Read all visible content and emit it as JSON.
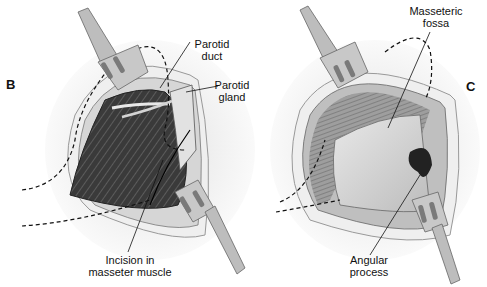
{
  "figure": {
    "panels": [
      {
        "id": "B",
        "letter": "B",
        "labels": {
          "parotid_duct": [
            "Parotid",
            "duct"
          ],
          "parotid_gland": [
            "Parotid",
            "gland"
          ],
          "incision": [
            "Incision in",
            "masseter muscle"
          ]
        }
      },
      {
        "id": "C",
        "letter": "C",
        "labels": {
          "masseteric_fossa": [
            "Masseteric",
            "fossa"
          ],
          "angular_process": [
            "Angular",
            "process"
          ]
        }
      }
    ],
    "colors": {
      "background": "#ffffff",
      "muscle_dark": "#2b2b2b",
      "muscle_mid": "#555555",
      "skin_edge": "#d8d8d8",
      "retractor": "#bdbdbd",
      "bone": "#cfcfcf",
      "line": "#111111"
    }
  }
}
